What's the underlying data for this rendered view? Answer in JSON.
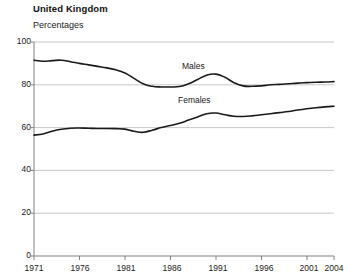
{
  "header": {
    "title": "United Kingdom",
    "subtitle": "Percentages"
  },
  "chart_data": {
    "type": "line",
    "title": "United Kingdom",
    "subtitle": "Percentages",
    "xlabel": "",
    "ylabel": "Percentages",
    "xlim": [
      1971,
      2004
    ],
    "ylim": [
      0,
      100
    ],
    "yticks": [
      0,
      20,
      40,
      60,
      80,
      100
    ],
    "xticks": [
      1971,
      1976,
      1981,
      1986,
      1991,
      1996,
      2001,
      2004
    ],
    "grid": "horizontal",
    "legend": "inline-labels",
    "x": [
      1971,
      1972,
      1973,
      1974,
      1975,
      1976,
      1977,
      1978,
      1979,
      1980,
      1981,
      1982,
      1983,
      1984,
      1985,
      1986,
      1987,
      1988,
      1989,
      1990,
      1991,
      1992,
      1993,
      1994,
      1995,
      1996,
      1997,
      1998,
      1999,
      2000,
      2001,
      2002,
      2003,
      2004
    ],
    "series": [
      {
        "name": "Males",
        "label": "Males",
        "color": "#1a1a1a",
        "values": [
          91.5,
          91.0,
          91.3,
          91.5,
          90.8,
          90.0,
          89.3,
          88.6,
          87.9,
          87.0,
          85.5,
          83.0,
          80.5,
          79.3,
          79.0,
          79.0,
          79.2,
          80.5,
          82.5,
          84.5,
          85.0,
          83.5,
          81.0,
          79.5,
          79.3,
          79.5,
          80.0,
          80.2,
          80.5,
          80.8,
          81.0,
          81.2,
          81.3,
          81.5
        ]
      },
      {
        "name": "Females",
        "label": "Females",
        "color": "#1a1a1a",
        "values": [
          56.5,
          57.0,
          58.3,
          59.2,
          59.7,
          59.8,
          59.7,
          59.6,
          59.6,
          59.5,
          59.3,
          58.3,
          57.8,
          58.8,
          60.0,
          61.0,
          62.0,
          63.5,
          65.0,
          66.5,
          66.8,
          66.0,
          65.3,
          65.2,
          65.5,
          66.0,
          66.5,
          67.0,
          67.5,
          68.2,
          68.8,
          69.3,
          69.7,
          70.0
        ]
      }
    ]
  },
  "axis_labels": {
    "y": [
      "100",
      "80",
      "60",
      "40",
      "20",
      "0"
    ],
    "x": [
      "1971",
      "1976",
      "1981",
      "1986",
      "1991",
      "1996",
      "2001",
      "2004"
    ]
  },
  "series_labels": {
    "males": "Males",
    "females": "Females"
  },
  "colors": {
    "line": "#1a1a1a",
    "grid": "#c8c8c8",
    "axis": "#808080",
    "text": "#1a1a1a",
    "background": "#ffffff"
  }
}
